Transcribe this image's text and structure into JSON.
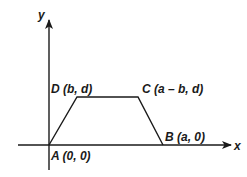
{
  "diagram": {
    "type": "coordinate-geometry",
    "shape": "isosceles trapezoid",
    "axes": {
      "x_label": "x",
      "y_label": "y"
    },
    "points": [
      {
        "id": "A",
        "name": "A",
        "coords": "(0, 0)",
        "label": "A (0, 0)"
      },
      {
        "id": "B",
        "name": "B",
        "coords": "(a, 0)",
        "label": "B (a, 0)"
      },
      {
        "id": "C",
        "name": "C",
        "coords": "(a – b, d)",
        "label": "C (a – b, d)"
      },
      {
        "id": "D",
        "name": "D",
        "coords": "(b, d)",
        "label": "D (b, d)"
      }
    ],
    "edges": [
      [
        "A",
        "D"
      ],
      [
        "D",
        "C"
      ],
      [
        "C",
        "B"
      ],
      [
        "B",
        "A"
      ]
    ],
    "colors": {
      "stroke": "#1a1a1a",
      "background": "#ffffff"
    }
  }
}
